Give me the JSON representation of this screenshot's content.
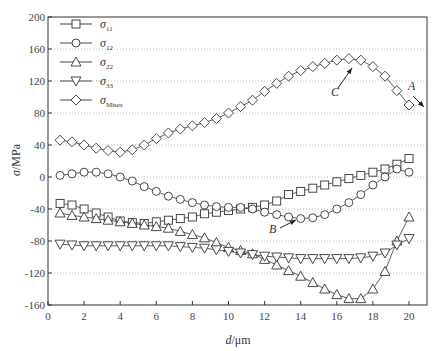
{
  "chart_data": {
    "type": "line",
    "title": "",
    "xlabel": "d/μm",
    "ylabel": "σ/MPa",
    "xlim": [
      0,
      21
    ],
    "ylim": [
      -160,
      200
    ],
    "xticks": [
      0,
      2,
      4,
      6,
      8,
      10,
      12,
      14,
      16,
      18,
      20
    ],
    "yticks": [
      -160,
      -120,
      -80,
      -40,
      0,
      40,
      80,
      120,
      160,
      200
    ],
    "grid": "horizontal dotted",
    "legend_position": "upper left",
    "x": [
      0.67,
      1.33,
      2.0,
      2.67,
      3.33,
      4.0,
      4.67,
      5.33,
      6.0,
      6.67,
      7.33,
      8.0,
      8.67,
      9.33,
      10.0,
      10.67,
      11.33,
      12.0,
      12.67,
      13.33,
      14.0,
      14.67,
      15.33,
      16.0,
      16.67,
      17.33,
      18.0,
      18.67,
      19.33,
      20.0
    ],
    "series": [
      {
        "name": "σ11",
        "marker": "square",
        "values": [
          -33,
          -35,
          -40,
          -45,
          -50,
          -55,
          -57,
          -58,
          -56,
          -54,
          -52,
          -50,
          -46,
          -44,
          -42,
          -40,
          -38,
          -35,
          -30,
          -22,
          -18,
          -14,
          -10,
          -6,
          -2,
          2,
          6,
          10,
          16,
          23
        ]
      },
      {
        "name": "σ12",
        "marker": "circle",
        "values": [
          2,
          4,
          6,
          6,
          4,
          0,
          -5,
          -12,
          -18,
          -24,
          -28,
          -32,
          -35,
          -37,
          -38,
          -38,
          -40,
          -44,
          -47,
          -50,
          -52,
          -51,
          -47,
          -40,
          -32,
          -22,
          -10,
          0,
          10,
          6
        ]
      },
      {
        "name": "σ22",
        "marker": "triangle-up",
        "values": [
          -45,
          -48,
          -50,
          -52,
          -54,
          -56,
          -58,
          -60,
          -62,
          -64,
          -68,
          -72,
          -76,
          -82,
          -88,
          -92,
          -96,
          -103,
          -110,
          -117,
          -124,
          -132,
          -140,
          -147,
          -152,
          -152,
          -140,
          -118,
          -80,
          -50
        ]
      },
      {
        "name": "σ33",
        "marker": "triangle-down",
        "values": [
          -84,
          -85,
          -86,
          -86,
          -86,
          -86,
          -86,
          -86,
          -86,
          -86,
          -87,
          -88,
          -89,
          -91,
          -93,
          -95,
          -97,
          -99,
          -100,
          -101,
          -102,
          -102,
          -102,
          -102,
          -102,
          -101,
          -99,
          -95,
          -85,
          -77
        ]
      },
      {
        "name": "σMises",
        "marker": "diamond",
        "values": [
          46,
          44,
          40,
          36,
          33,
          31,
          34,
          40,
          48,
          55,
          60,
          64,
          68,
          73,
          80,
          88,
          96,
          107,
          117,
          126,
          133,
          138,
          142,
          146,
          148,
          146,
          138,
          126,
          108,
          90
        ]
      }
    ],
    "annotations": [
      {
        "text": "A",
        "target_series": "σ11",
        "x": 20.0,
        "y": 23
      },
      {
        "text": "B",
        "target_series": "σ12",
        "x": 14.0,
        "y": -52
      },
      {
        "text": "C",
        "target_series": "σMises",
        "x": 16.67,
        "y": 148
      }
    ]
  },
  "legend": [
    {
      "sym": "σ",
      "sub": "11",
      "marker": "square"
    },
    {
      "sym": "σ",
      "sub": "12",
      "marker": "circle"
    },
    {
      "sym": "σ",
      "sub": "22",
      "marker": "triangle-up"
    },
    {
      "sym": "σ",
      "sub": "33",
      "marker": "triangle-down"
    },
    {
      "sym": "σ",
      "sub": "Mises",
      "marker": "diamond"
    }
  ],
  "axes": {
    "xlabel_italic": "d",
    "xlabel_rest": "/μm",
    "ylabel_italic": "σ",
    "ylabel_rest": "/MPa"
  }
}
